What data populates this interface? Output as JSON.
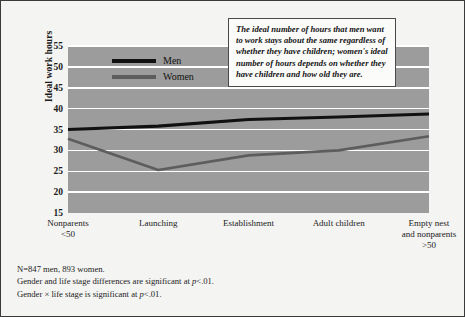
{
  "chart_data": {
    "type": "line",
    "title": "",
    "xlabel": "",
    "ylabel": "Ideal work hours",
    "ylim": [
      15,
      55
    ],
    "yticks": [
      15,
      20,
      25,
      30,
      35,
      40,
      45,
      50,
      55
    ],
    "grid": true,
    "legend_position": "top-left-inside",
    "categories": [
      "Nonparents\n<50",
      "Launching",
      "Establishment",
      "Adult children",
      "Empty nest\nand nonparents\n>50"
    ],
    "category_lines": [
      [
        "Nonparents",
        "<50"
      ],
      [
        "Launching"
      ],
      [
        "Establishment"
      ],
      [
        "Adult children"
      ],
      [
        "Empty nest",
        "and nonparents",
        ">50"
      ]
    ],
    "series": [
      {
        "name": "Men",
        "values": [
          35.0,
          35.8,
          37.4,
          38.0,
          38.7
        ],
        "color": "#111111"
      },
      {
        "name": "Women",
        "values": [
          32.8,
          25.3,
          28.8,
          30.0,
          33.4
        ],
        "color": "#5d5d5d"
      }
    ],
    "annotations": [
      "The ideal number of hours that men want to work stays about the same regardless of whether they have children; women's ideal number of hours depends on whether they have children and how old they are."
    ],
    "plot_background": "#9c9c9c",
    "gridline_color": "#ffffff"
  },
  "legend": {
    "items": [
      {
        "label": "Men"
      },
      {
        "label": "Women"
      }
    ]
  },
  "callout": {
    "text": "The ideal number of hours that men want to work stays about the same regardless of whether they have children; women's ideal number of hours depends on whether they have children and how old they are."
  },
  "footnotes": {
    "line1": "N=847 men, 893 women.",
    "line2_pre": "Gender and life stage differences are significant at ",
    "line2_p": "p",
    "line2_post": "<.01.",
    "line3_pre": "Gender × life stage is significant at ",
    "line3_p": "p",
    "line3_post": "<.01."
  }
}
